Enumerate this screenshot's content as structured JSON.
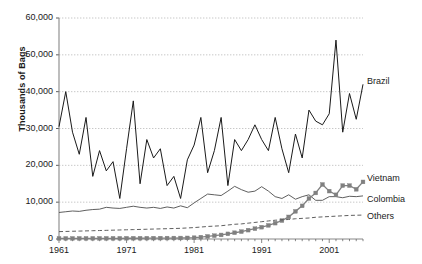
{
  "chart_data": {
    "type": "line",
    "title": "",
    "xlabel": "",
    "ylabel": "Thousands of Bags",
    "xlim": [
      1961,
      2006
    ],
    "ylim": [
      0,
      60000
    ],
    "grid": true,
    "legend_position": "right-inline",
    "xticks": [
      "1961",
      "1971",
      "1981",
      "1991",
      "2001"
    ],
    "xtick_values": [
      1961,
      1971,
      1981,
      1991,
      2001
    ],
    "yticks": [
      "0",
      "10,000",
      "20,000",
      "30,000",
      "40,000",
      "50,000",
      "60,000"
    ],
    "ytick_values": [
      0,
      10000,
      20000,
      30000,
      40000,
      50000,
      60000
    ],
    "x": [
      1961,
      1962,
      1963,
      1964,
      1965,
      1966,
      1967,
      1968,
      1969,
      1970,
      1971,
      1972,
      1973,
      1974,
      1975,
      1976,
      1977,
      1978,
      1979,
      1980,
      1981,
      1982,
      1983,
      1984,
      1985,
      1986,
      1987,
      1988,
      1989,
      1990,
      1991,
      1992,
      1993,
      1994,
      1995,
      1996,
      1997,
      1998,
      1999,
      2000,
      2001,
      2002,
      2003,
      2004,
      2005,
      2006
    ],
    "series": [
      {
        "name": "Brazil",
        "style": "solid",
        "color": "#1a1a1a",
        "marker": "none",
        "values": [
          30500,
          40000,
          29000,
          23000,
          33000,
          17000,
          24000,
          18500,
          21000,
          11000,
          24500,
          37500,
          15000,
          27000,
          22000,
          24500,
          14500,
          17000,
          11000,
          21500,
          25500,
          33000,
          18000,
          24000,
          33000,
          14500,
          27000,
          24000,
          27000,
          31000,
          27000,
          24000,
          33000,
          24500,
          18000,
          28500,
          22000,
          35000,
          32000,
          31000,
          34000,
          54000,
          29000,
          39500,
          32500,
          42000
        ]
      },
      {
        "name": "Colombia",
        "style": "solid",
        "color": "#4d4d4d",
        "marker": "none",
        "values": [
          7200,
          7400,
          7600,
          7500,
          7800,
          8000,
          8100,
          8600,
          8400,
          8300,
          8600,
          8900,
          8600,
          8400,
          8600,
          8300,
          8700,
          8400,
          9000,
          8500,
          9800,
          11000,
          12200,
          12000,
          11800,
          13000,
          14300,
          13400,
          12700,
          13000,
          14200,
          13000,
          11500,
          11000,
          12000,
          10800,
          11500,
          12000,
          10500,
          10500,
          11500,
          11500,
          11200,
          11600,
          11500,
          11700
        ]
      },
      {
        "name": "Vietnam",
        "style": "solid",
        "color": "#808080",
        "marker": "square",
        "values": [
          150,
          160,
          160,
          170,
          170,
          175,
          180,
          180,
          190,
          190,
          200,
          210,
          210,
          220,
          230,
          240,
          250,
          260,
          270,
          300,
          350,
          500,
          700,
          900,
          1100,
          1400,
          1700,
          2000,
          2400,
          2800,
          3200,
          3700,
          4300,
          5000,
          6000,
          7500,
          9000,
          11000,
          12500,
          14800,
          13000,
          12000,
          14500,
          14500,
          13500,
          15500
        ]
      },
      {
        "name": "Others",
        "style": "dashed",
        "color": "#4d4d4d",
        "marker": "none",
        "values": [
          2000,
          2050,
          2100,
          2150,
          2200,
          2250,
          2300,
          2350,
          2400,
          2450,
          2500,
          2550,
          2600,
          2650,
          2700,
          2750,
          2800,
          2850,
          2900,
          3000,
          3100,
          3250,
          3400,
          3500,
          3600,
          3800,
          4000,
          4100,
          4300,
          4500,
          4700,
          4900,
          5100,
          5200,
          5300,
          5500,
          5600,
          5700,
          5900,
          6000,
          6100,
          6200,
          6300,
          6400,
          6450,
          6500
        ]
      }
    ]
  },
  "labels": {
    "brazil": "Brazil",
    "colombia": "Colombia",
    "vietnam": "Vietnam",
    "others": "Others"
  }
}
